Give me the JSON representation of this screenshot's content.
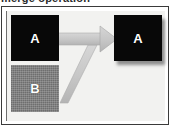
{
  "figure": {
    "caption": "merge operation",
    "type": "merge-diagram",
    "background_color": "#f2f2f0",
    "frame_color": "#3a3a3a"
  },
  "nodes": [
    {
      "id": "a-source",
      "label": "A",
      "role": "source",
      "fill": "black",
      "fill_color": "#080808",
      "text_color": "#ffffff",
      "position": "top-left"
    },
    {
      "id": "b-source",
      "label": "B",
      "role": "source",
      "fill": "dithered-gray",
      "fill_color": "#808080",
      "text_color": "#ffffff",
      "position": "bottom-left"
    },
    {
      "id": "a-result",
      "label": "A",
      "role": "result",
      "fill": "black",
      "fill_color": "#080808",
      "text_color": "#ffffff",
      "position": "right",
      "has_shadow": true
    }
  ],
  "connector": {
    "id": "merge-arrow",
    "kind": "merging-arrow",
    "direction": "right",
    "color": "#c9c9c9",
    "edge_color": "#a8a8a8",
    "branches": [
      {
        "from": "a-source",
        "to": "a-result",
        "path": "horizontal"
      },
      {
        "from": "b-source",
        "to": "a-result",
        "path": "diagonal-up-right"
      }
    ],
    "arrowhead": "triangle-right"
  },
  "icons": {
    "arrow": "arrow-right-icon"
  }
}
